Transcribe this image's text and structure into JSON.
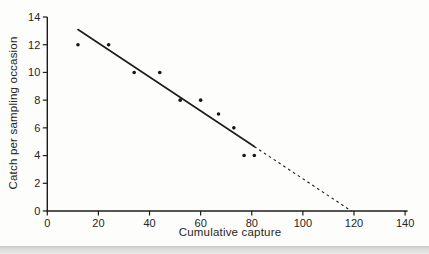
{
  "chart_data": {
    "type": "scatter",
    "title": "",
    "xlabel": "Cumulative capture",
    "ylabel": "Catch per sampling occasion",
    "xlim": [
      0,
      140
    ],
    "ylim": [
      0,
      14
    ],
    "x_ticks": [
      0,
      20,
      40,
      60,
      80,
      100,
      120,
      140
    ],
    "y_ticks": [
      0,
      2,
      4,
      6,
      8,
      10,
      12,
      14
    ],
    "grid": false,
    "legend": "none",
    "points": [
      [
        12,
        12
      ],
      [
        24,
        12
      ],
      [
        34,
        10
      ],
      [
        44,
        10
      ],
      [
        52,
        8
      ],
      [
        60,
        8
      ],
      [
        67,
        7
      ],
      [
        73,
        6
      ],
      [
        77,
        4
      ],
      [
        81,
        4
      ]
    ],
    "trend_line": {
      "x_start": 12,
      "y_start": 13.1,
      "x_end": 119,
      "y_end": 0,
      "solid_until_x": 81,
      "style_after": "dashed"
    },
    "colors": {
      "ink": "#1c1c1c",
      "point": "#161616",
      "tick_text": "#262626",
      "background": "#fdfdfc",
      "page_edge_strip": "#d9d9d8"
    }
  }
}
